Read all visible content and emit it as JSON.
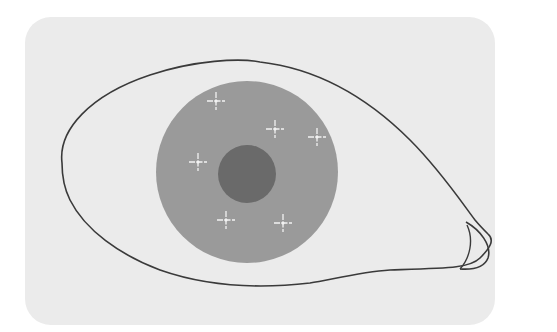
{
  "diagram": {
    "colors": {
      "page_background": "#ffffff",
      "panel_background": "#ebebeb",
      "eye_outline": "#3a3a3a",
      "iris": "#9a9a9a",
      "pupil": "#6a6a6a",
      "sparkle": "#f2f2f2"
    },
    "panel": {
      "x": 25,
      "y": 17,
      "width": 470,
      "height": 308,
      "radius": 26
    },
    "iris": {
      "cx": 247,
      "cy": 172,
      "r": 91
    },
    "pupil": {
      "cx": 247,
      "cy": 174,
      "r": 29
    },
    "sparkles": [
      {
        "x": 216,
        "y": 101
      },
      {
        "x": 275,
        "y": 129
      },
      {
        "x": 317,
        "y": 137
      },
      {
        "x": 198,
        "y": 162
      },
      {
        "x": 226,
        "y": 220
      },
      {
        "x": 283,
        "y": 223
      }
    ]
  }
}
